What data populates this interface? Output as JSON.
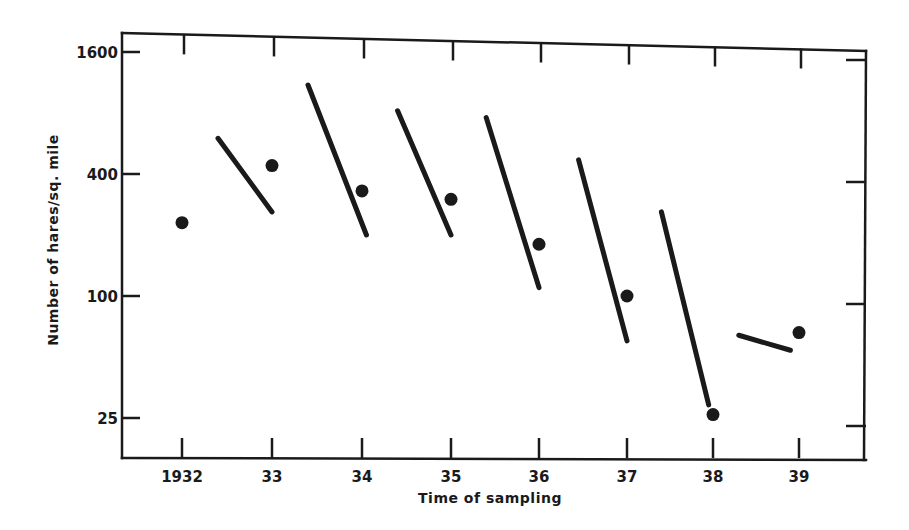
{
  "chart_data": {
    "type": "scatter",
    "title": "",
    "xlabel": "Time of sampling",
    "ylabel": "Number of hares/sq. mile",
    "yscale": "log",
    "ylim": [
      18,
      1600
    ],
    "grid": false,
    "legend": null,
    "x_ticks": [
      {
        "label": "1932",
        "year": 1932
      },
      {
        "label": "33",
        "year": 1933
      },
      {
        "label": "34",
        "year": 1934
      },
      {
        "label": "35",
        "year": 1935
      },
      {
        "label": "36",
        "year": 1936
      },
      {
        "label": "37",
        "year": 1937
      },
      {
        "label": "38",
        "year": 1938
      },
      {
        "label": "39",
        "year": 1939
      }
    ],
    "y_ticks": [
      {
        "label": "1600",
        "value": 1600
      },
      {
        "label": "400",
        "value": 400
      },
      {
        "label": "100",
        "value": 100
      },
      {
        "label": "25",
        "value": 25
      }
    ],
    "series": [
      {
        "name": "Sampled density (points)",
        "kind": "points",
        "x": [
          1932,
          1933,
          1934,
          1935,
          1936,
          1937,
          1938,
          1939
        ],
        "values": [
          230,
          440,
          330,
          300,
          180,
          100,
          26,
          66
        ]
      },
      {
        "name": "Within-year decline (segments)",
        "kind": "segments",
        "segments": [
          {
            "x_start": 1932.4,
            "x_end": 1933.0,
            "y_start": 600,
            "y_end": 260
          },
          {
            "x_start": 1933.4,
            "x_end": 1934.05,
            "y_start": 1100,
            "y_end": 200
          },
          {
            "x_start": 1934.4,
            "x_end": 1935.0,
            "y_start": 820,
            "y_end": 200
          },
          {
            "x_start": 1935.4,
            "x_end": 1936.0,
            "y_start": 760,
            "y_end": 110
          },
          {
            "x_start": 1936.45,
            "x_end": 1937.0,
            "y_start": 470,
            "y_end": 60
          },
          {
            "x_start": 1937.4,
            "x_end": 1937.95,
            "y_start": 260,
            "y_end": 29
          },
          {
            "x_start": 1938.3,
            "x_end": 1938.9,
            "y_start": 64,
            "y_end": 54
          }
        ]
      }
    ]
  },
  "layout": {
    "frame": {
      "left": 122,
      "right": 866,
      "top_left": 33,
      "top_right": 50,
      "bottom": 458
    },
    "x_pixel": {
      "1932": 182,
      "1933": 272,
      "1934": 362,
      "1935": 451,
      "1936": 539,
      "1937": 627,
      "1938": 713,
      "1939": 799
    },
    "y_pixel": {
      "1600": 50,
      "400": 170,
      "100": 296,
      "25": 418
    },
    "ink_color": "#1a1a1a",
    "background": "#ffffff"
  }
}
